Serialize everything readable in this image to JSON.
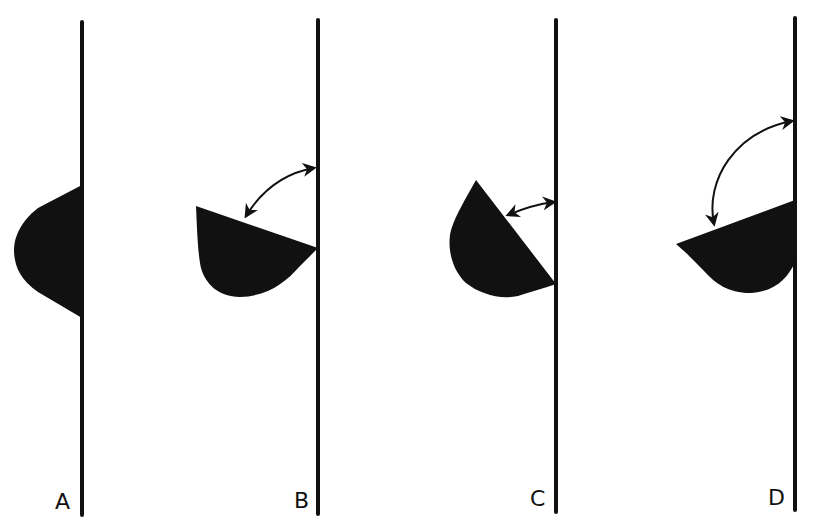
{
  "figure": {
    "stroke_color": "#111111",
    "fill_color": "#111111",
    "background": "#ffffff"
  },
  "panels": [
    {
      "label": "A",
      "has_arrow": false
    },
    {
      "label": "B",
      "has_arrow": true,
      "arrow": "double-headed curved arrow indicating angle"
    },
    {
      "label": "C",
      "has_arrow": true,
      "arrow": "double-headed short arrow indicating angle"
    },
    {
      "label": "D",
      "has_arrow": true,
      "arrow": "double-headed curved arrow indicating angle"
    }
  ]
}
